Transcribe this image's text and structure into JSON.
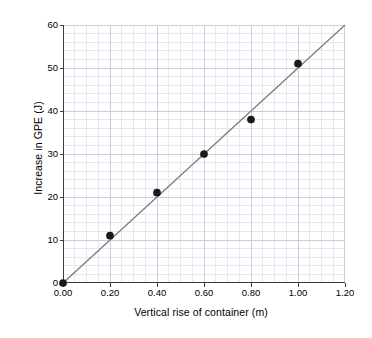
{
  "chart_data": {
    "type": "scatter",
    "title": "",
    "subtitle": "",
    "xlabel": "Vertical rise of container (m)",
    "ylabel": "Increase in GPE (J)",
    "xlim": [
      0.0,
      1.2
    ],
    "ylim": [
      0,
      60
    ],
    "x_ticks": [
      0.0,
      0.2,
      0.4,
      0.6,
      0.8,
      1.0,
      1.2
    ],
    "x_tick_labels": [
      "0.00",
      "0.20",
      "0.40",
      "0.60",
      "0.80",
      "1.00",
      "1.20"
    ],
    "y_ticks": [
      0,
      10,
      20,
      30,
      40,
      50,
      60
    ],
    "y_tick_labels": [
      "0",
      "10",
      "20",
      "30",
      "40",
      "50",
      "60"
    ],
    "grid": true,
    "grid_minor": true,
    "grid_minor_x_divisions": 4,
    "grid_minor_y_divisions": 5,
    "legend": "none",
    "x": [
      0.0,
      0.2,
      0.4,
      0.6,
      0.8,
      1.0
    ],
    "y": [
      0,
      11,
      21,
      30,
      38,
      51
    ],
    "series": [
      {
        "name": "Measured points",
        "marker": "filled-circle",
        "marker_color": "#1a1a1a",
        "marker_size_px": 4,
        "x": [
          0.0,
          0.2,
          0.4,
          0.6,
          0.8,
          1.0
        ],
        "values": [
          0,
          11,
          21,
          30,
          38,
          51
        ]
      },
      {
        "name": "Line of best fit",
        "type": "line",
        "line_color": "#7f7f7f",
        "line_width_px": 1.4,
        "x": [
          0.0,
          1.2
        ],
        "values": [
          0,
          60
        ],
        "slope": 50,
        "intercept": 0
      }
    ],
    "colors": {
      "axis": "#3c3c3c",
      "grid_major": "#c9cede",
      "grid_minor": "#e4e7f0",
      "marker": "#1a1a1a",
      "trend_line": "#7f7f7f",
      "text": "#000000",
      "background": "#ffffff"
    }
  }
}
